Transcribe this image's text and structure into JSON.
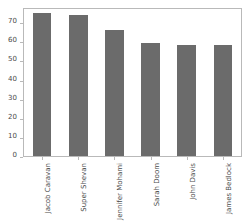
{
  "chart_data": {
    "type": "bar",
    "title": "",
    "xlabel": "",
    "ylabel": "",
    "categories": [
      "Jacob Caravan",
      "Super Shevan",
      "Jennifer Mohami",
      "Sarah Doom",
      "John Davis",
      "James Bedlock"
    ],
    "values": [
      76,
      75,
      67,
      60,
      59,
      59
    ],
    "ylim": [
      0,
      78
    ],
    "yticks": [
      0,
      10,
      20,
      30,
      40,
      50,
      60,
      70
    ],
    "ytick_labels": [
      "0",
      "10",
      "20",
      "30",
      "40",
      "50",
      "60",
      "70"
    ],
    "grid": false,
    "legend": false,
    "bar_color": "#6b6b6b",
    "axis_color": "#b9b9b9",
    "background_color": "#ffffff",
    "tick_label_color": "#4a4a4a",
    "xtick_label_rotation": -90
  }
}
